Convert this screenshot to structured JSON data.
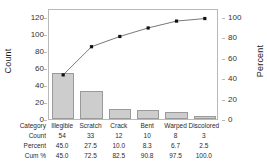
{
  "chart_data": {
    "type": "bar",
    "title": "",
    "subtitle": "",
    "categories": [
      "Illegible",
      "Scratch",
      "Crack",
      "Bent",
      "Warped",
      "Discolored"
    ],
    "values": [
      54,
      33,
      12,
      10,
      8,
      3
    ],
    "series": [
      {
        "name": "Count",
        "values": [
          54,
          33,
          12,
          10,
          8,
          3
        ]
      },
      {
        "name": "Cum %",
        "values": [
          45.0,
          72.5,
          82.5,
          90.8,
          97.5,
          100.0
        ]
      }
    ],
    "percent": [
      45.0,
      27.5,
      10.0,
      8.3,
      6.7,
      2.5
    ],
    "xlabel": "",
    "ylabel": "Count",
    "y2label": "Percent",
    "ylim": [
      0,
      130
    ],
    "y2lim": [
      0,
      108.33
    ],
    "yticks": [
      0,
      20,
      40,
      60,
      80,
      100,
      120
    ],
    "y2ticks": [
      0,
      20,
      40,
      60,
      80,
      100
    ],
    "grid": false,
    "legend": "none",
    "bar_color": "#cdcdcd",
    "bar_edge_color": "#9a9a9a",
    "line_color": "#555555",
    "marker_color": "#111111"
  },
  "axes": {
    "left_title": "Count",
    "right_title": "Percent",
    "left_ticks": [
      "120",
      "100",
      "80",
      "60",
      "40",
      "20",
      "0"
    ],
    "right_ticks": [
      "100",
      "80",
      "60",
      "40",
      "20",
      "0"
    ]
  },
  "table": {
    "row_labels": [
      "Category",
      "Count",
      "Percent",
      "Cum %"
    ],
    "categories": [
      "Illegible",
      "Scratch",
      "Crack",
      "Bent",
      "Warped",
      "Discolored"
    ],
    "count": [
      "54",
      "33",
      "12",
      "10",
      "8",
      "3"
    ],
    "percent": [
      "45.0",
      "27.5",
      "10.0",
      "8.3",
      "6.7",
      "2.5"
    ],
    "cum_percent": [
      "45.0",
      "72.5",
      "82.5",
      "90.8",
      "97.5",
      "100.0"
    ]
  }
}
